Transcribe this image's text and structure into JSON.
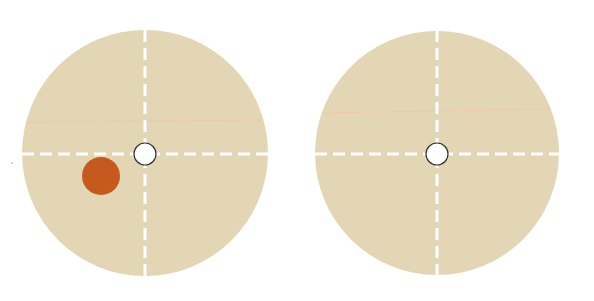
{
  "colors": {
    "background": "#ffffff",
    "disc_fill": "#e3d6b4",
    "crosshair": "#ffffff",
    "faint_line": "#f0c9a8",
    "hole_fill": "#ffffff",
    "hole_stroke": "#333333",
    "marker": "#c65a1e"
  },
  "discs": [
    {
      "id": "left",
      "cx": 145,
      "cy": 153,
      "r": 123,
      "faint_line_y": 122,
      "marker": {
        "cx": 101,
        "cy": 176,
        "r": 19
      }
    },
    {
      "id": "right",
      "cx": 437,
      "cy": 153,
      "r": 122,
      "faint_line_y": 112,
      "marker": null
    }
  ],
  "hole_radius": 11
}
